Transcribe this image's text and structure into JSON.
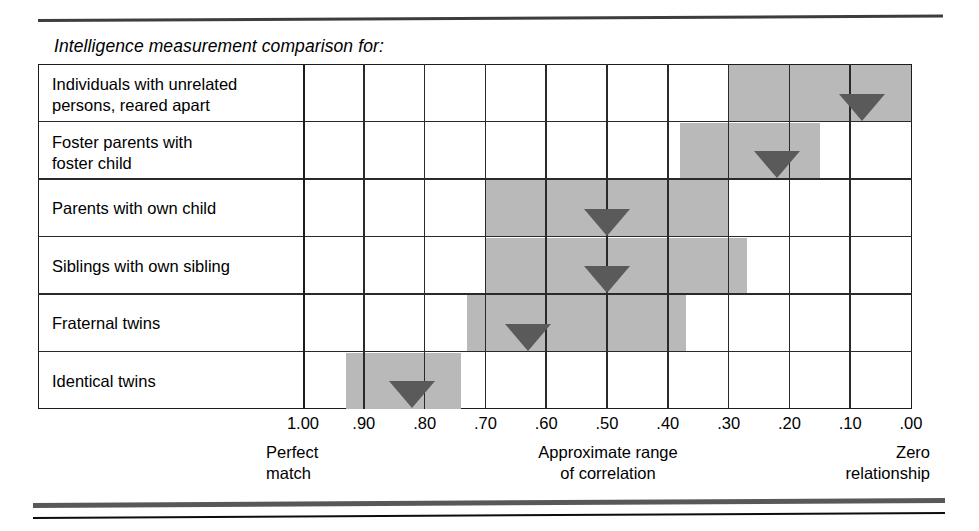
{
  "caption": "Intelligence measurement comparison for:",
  "chart_data": {
    "type": "bar",
    "title": "Intelligence measurement comparison for:",
    "xlabel": "Approximate range of correlation",
    "ylabel": "",
    "xlim": [
      1.0,
      0.0
    ],
    "x_axis_direction": "descending",
    "grid": true,
    "legend": "none",
    "tick_labels": [
      "1.00",
      ".90",
      ".80",
      ".70",
      ".60",
      ".50",
      ".40",
      ".30",
      ".20",
      ".10",
      ".00"
    ],
    "tick_values": [
      1.0,
      0.9,
      0.8,
      0.7,
      0.6,
      0.5,
      0.4,
      0.3,
      0.2,
      0.1,
      0.0
    ],
    "axis_notes": {
      "left_line1": "Perfect",
      "left_line2": "match",
      "center_line1": "Approximate range",
      "center_line2": "of correlation",
      "right_line1": "Zero",
      "right_line2": "relationship"
    },
    "categories": [
      "Individuals with unrelated persons, reared apart",
      "Foster parents with foster child",
      "Parents with own child",
      "Siblings with own sibling",
      "Fraternal twins",
      "Identical twins"
    ],
    "rows": [
      {
        "label_line1": "Individuals with unrelated",
        "label_line2": "persons, reared apart",
        "range_low": 0.0,
        "range_high": 0.3,
        "marker": 0.08
      },
      {
        "label_line1": "Foster parents with",
        "label_line2": "foster child",
        "range_low": 0.15,
        "range_high": 0.38,
        "marker": 0.22
      },
      {
        "label_line1": "Parents with own child",
        "label_line2": "",
        "range_low": 0.3,
        "range_high": 0.7,
        "marker": 0.5
      },
      {
        "label_line1": "Siblings with own sibling",
        "label_line2": "",
        "range_low": 0.27,
        "range_high": 0.7,
        "marker": 0.5
      },
      {
        "label_line1": "Fraternal twins",
        "label_line2": "",
        "range_low": 0.37,
        "range_high": 0.73,
        "marker": 0.63
      },
      {
        "label_line1": "Identical twins",
        "label_line2": "",
        "range_low": 0.74,
        "range_high": 0.93,
        "marker": 0.82
      }
    ],
    "colors": {
      "range_fill": "#b9b9b9",
      "marker_fill": "#5a5a5a",
      "gridline": "#2a2a2a",
      "border": "#1c1c1c",
      "background": "#ffffff"
    }
  }
}
